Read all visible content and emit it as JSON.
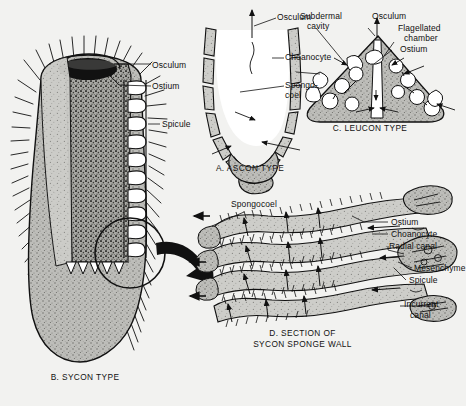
{
  "figure": {
    "background_color": "#f2f2f0",
    "ink_color": "#111111",
    "body_fill": "#b8b8b4",
    "dark_fill": "#1a1a1a",
    "panels": [
      {
        "id": "panel-b",
        "caption": "B. SYCON TYPE",
        "labels": [
          "Osculum",
          "Ostium",
          "Spicule"
        ]
      },
      {
        "id": "panel-a",
        "caption": "A. ASCON TYPE",
        "labels": [
          "Osculum",
          "Choanocyte",
          "Spongo-",
          "coel"
        ]
      },
      {
        "id": "panel-c",
        "caption": "C. LEUCON TYPE",
        "labels": [
          "Subdermal",
          "cavity",
          "Osculum",
          "Flagellated",
          "chamber",
          "Ostium"
        ]
      },
      {
        "id": "panel-d",
        "caption_line1": "D. SECTION OF",
        "caption_line2": "SYCON SPONGE WALL",
        "labels": [
          "Spongocoel",
          "Ostium",
          "Choanocyte",
          "Radial canal",
          "Mesenchyme",
          "Spicule",
          "Incurrent",
          "canal"
        ]
      }
    ]
  },
  "panel_b": {
    "caption": "B. SYCON TYPE",
    "label_osculum": "Osculum",
    "label_ostium": "Ostium",
    "label_spicule": "Spicule"
  },
  "panel_a": {
    "caption": "A. ASCON TYPE",
    "label_osculum": "Osculum",
    "label_choanocyte": "Choanocyte",
    "label_spongocoel_line1": "Spongo-",
    "label_spongocoel_line2": "coel"
  },
  "panel_c": {
    "caption": "C. LEUCON TYPE",
    "label_subdermal_line1": "Subdermal",
    "label_subdermal_line2": "cavity",
    "label_osculum": "Osculum",
    "label_flagellated_line1": "Flagellated",
    "label_flagellated_line2": "chamber",
    "label_ostium": "Ostium"
  },
  "panel_d": {
    "caption_line1": "D. SECTION OF",
    "caption_line2": "SYCON SPONGE WALL",
    "label_spongocoel": "Spongocoel",
    "label_ostium": "Ostium",
    "label_choanocyte": "Choanocyte",
    "label_radial_canal": "Radial canal",
    "label_mesenchyme": "Mesenchyme",
    "label_spicule": "Spicule",
    "label_incurrent_line1": "Incurrent",
    "label_incurrent_line2": "canal"
  }
}
